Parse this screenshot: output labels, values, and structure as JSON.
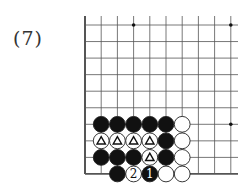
{
  "diagram": {
    "label": "(7)",
    "board": {
      "origin_x": 85,
      "origin_y": 25,
      "spacing_x": 16.2,
      "spacing_y": 16.55,
      "cols": 10,
      "rows": 10,
      "line_extend_right": 238,
      "line_color": "#555555",
      "edge_left": true,
      "edge_bottom": true,
      "star_points": [
        [
          3,
          0
        ],
        [
          9,
          0
        ],
        [
          9,
          6
        ]
      ]
    },
    "stones": [
      {
        "col": 1,
        "row": 6,
        "color": "black"
      },
      {
        "col": 2,
        "row": 6,
        "color": "black"
      },
      {
        "col": 3,
        "row": 6,
        "color": "black"
      },
      {
        "col": 4,
        "row": 6,
        "color": "black"
      },
      {
        "col": 5,
        "row": 6,
        "color": "black"
      },
      {
        "col": 6,
        "row": 6,
        "color": "white"
      },
      {
        "col": 1,
        "row": 7,
        "color": "white",
        "mark": "triangle"
      },
      {
        "col": 2,
        "row": 7,
        "color": "white",
        "mark": "triangle"
      },
      {
        "col": 3,
        "row": 7,
        "color": "white",
        "mark": "triangle"
      },
      {
        "col": 4,
        "row": 7,
        "color": "white",
        "mark": "triangle"
      },
      {
        "col": 5,
        "row": 7,
        "color": "black"
      },
      {
        "col": 6,
        "row": 7,
        "color": "white"
      },
      {
        "col": 1,
        "row": 8,
        "color": "black"
      },
      {
        "col": 2,
        "row": 8,
        "color": "black"
      },
      {
        "col": 3,
        "row": 8,
        "color": "black"
      },
      {
        "col": 4,
        "row": 8,
        "color": "white",
        "mark": "triangle"
      },
      {
        "col": 5,
        "row": 8,
        "color": "black"
      },
      {
        "col": 6,
        "row": 8,
        "color": "white"
      },
      {
        "col": 2,
        "row": 9,
        "color": "black"
      },
      {
        "col": 3,
        "row": 9,
        "color": "white",
        "number": "2"
      },
      {
        "col": 4,
        "row": 9,
        "color": "black",
        "number": "1"
      },
      {
        "col": 5,
        "row": 9,
        "color": "white"
      },
      {
        "col": 6,
        "row": 9,
        "color": "white"
      }
    ]
  }
}
